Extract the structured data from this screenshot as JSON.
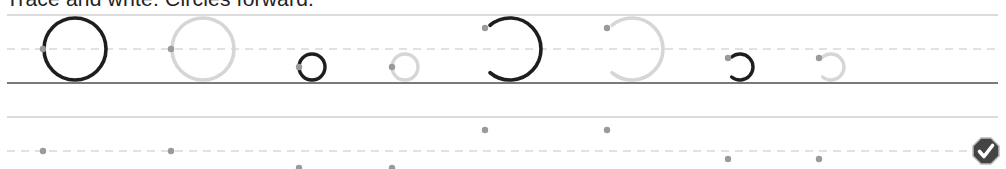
{
  "instruction": "Trace and write. Circles forward.",
  "colors": {
    "guide_line": "#cfcfcf",
    "baseline": "#7a7a7a",
    "dash_line": "#c4c4c4",
    "model_stroke": "#1e1e1e",
    "trace_stroke": "#d6d6d6",
    "start_dot": "#9a9a9a",
    "badge_fill": "#444444"
  },
  "row1": {
    "top_y": 15,
    "mid_y": 49,
    "base_y": 83,
    "items": [
      {
        "kind": "full-circle",
        "style": "model",
        "cx": 75,
        "cy": 49,
        "r": 31,
        "dot": [
          43,
          49
        ]
      },
      {
        "kind": "full-circle",
        "style": "trace",
        "cx": 203,
        "cy": 49,
        "r": 31,
        "dot": [
          171,
          49
        ]
      },
      {
        "kind": "full-circle",
        "style": "model",
        "cx": 312,
        "cy": 67,
        "r": 13,
        "dot": [
          299,
          67
        ]
      },
      {
        "kind": "full-circle",
        "style": "trace",
        "cx": 405,
        "cy": 67,
        "r": 13,
        "dot": [
          392,
          67
        ]
      },
      {
        "kind": "arc",
        "style": "model",
        "cx": 510,
        "cy": 49,
        "r": 31,
        "dot": [
          485,
          28
        ]
      },
      {
        "kind": "arc",
        "style": "trace",
        "cx": 632,
        "cy": 49,
        "r": 31,
        "dot": [
          607,
          28
        ]
      },
      {
        "kind": "arc",
        "style": "model",
        "cx": 740,
        "cy": 67,
        "r": 13,
        "dot": [
          728,
          58
        ]
      },
      {
        "kind": "arc",
        "style": "trace",
        "cx": 831,
        "cy": 67,
        "r": 13,
        "dot": [
          819,
          58
        ]
      }
    ]
  },
  "row2": {
    "top_y": 117,
    "mid_y": 151,
    "dots": [
      [
        43,
        151
      ],
      [
        171,
        151
      ],
      [
        299,
        168
      ],
      [
        392,
        168
      ],
      [
        485,
        130
      ],
      [
        607,
        130
      ],
      [
        728,
        159
      ],
      [
        819,
        159
      ]
    ]
  },
  "check_badge": {
    "icon": "check-octagon-icon",
    "label": "check"
  }
}
